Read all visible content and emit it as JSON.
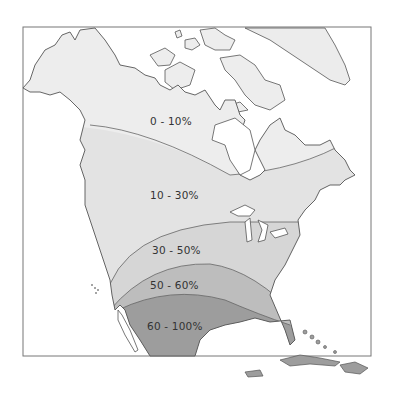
{
  "map": {
    "region": "North America",
    "zones": [
      {
        "label": "0 - 10%",
        "color": "#ededed"
      },
      {
        "label": "10 - 30%",
        "color": "#e4e4e4"
      },
      {
        "label": "30 - 50%",
        "color": "#d6d6d6"
      },
      {
        "label": "50 - 60%",
        "color": "#bdbdbd"
      },
      {
        "label": "60 - 100%",
        "color": "#9d9d9d"
      }
    ],
    "border_color": "#555555",
    "ocean_color": "#ffffff"
  }
}
